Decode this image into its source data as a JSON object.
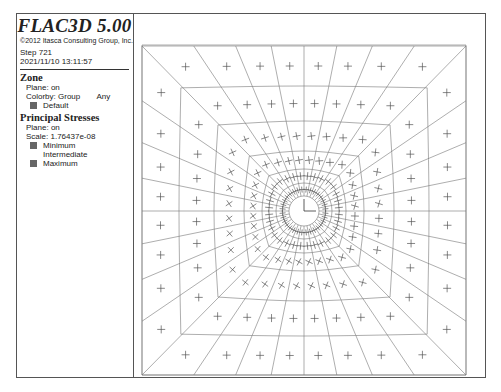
{
  "legend": {
    "title": "FLAC3D 5.00",
    "copyright": "©2012 Itasca Consulting Group, Inc.",
    "step": "Step 721",
    "timestamp": "2021/11/10 13:11:57",
    "zone": {
      "heading": "Zone",
      "plane": "Plane: on",
      "colorby": "Colorby: Group",
      "colorby_scope": "Any",
      "groups": [
        {
          "label": "Default",
          "color": "#666666"
        }
      ]
    },
    "principal_stresses": {
      "heading": "Principal Stresses",
      "plane": "Plane: on",
      "scale": "Scale: 1.76437e-08",
      "entries": [
        {
          "label": "Minimum",
          "color": "#666666",
          "swatch": true
        },
        {
          "label": "Intermediate",
          "color": "",
          "swatch": false
        },
        {
          "label": "Maximum",
          "color": "#666666",
          "swatch": true
        }
      ]
    }
  },
  "viewport": {
    "description": "Square mesh with circular tunnel opening at center; radial zones with principal-stress crosses",
    "line_color": "#777777",
    "stress_color": "#555555"
  }
}
